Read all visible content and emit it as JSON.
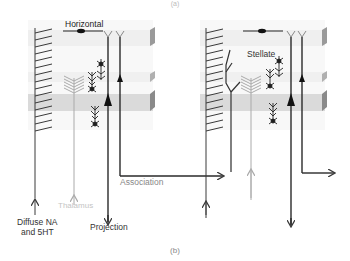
{
  "figure": {
    "top_label": "(a)",
    "bottom_label": "(b)"
  },
  "labels": {
    "horizontal": "Horizontal",
    "stellate": "Stellate",
    "association": "Association",
    "thalamus": "Thalamus",
    "diffuse_line1": "Diffuse NA",
    "diffuse_line2": "and 5HT",
    "projection": "Projection"
  },
  "colors": {
    "dark": "#3a3a3a",
    "light_gray": "#aaaaaa",
    "band": "#dcdcdc",
    "band_light": "#eeeeee",
    "panel": "#f7f7f7",
    "edge": "#999999"
  },
  "panels": [
    {
      "name": "left-cortex-column",
      "x": 28,
      "y": 20,
      "w": 125,
      "h": 110
    },
    {
      "name": "right-cortex-column",
      "x": 200,
      "y": 20,
      "w": 125,
      "h": 110
    }
  ]
}
